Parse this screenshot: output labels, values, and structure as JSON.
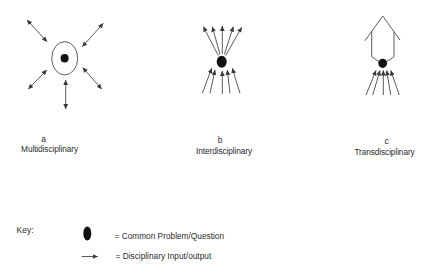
{
  "colors": {
    "background": "#ffffff",
    "line": "#4a4a4a",
    "dot": "#111111",
    "text": "#2b2b2b"
  },
  "diagrams": [
    {
      "letter": "a",
      "label": "Multidisciplinary",
      "ring": {
        "cx": 64.7,
        "cy": 58.3,
        "rx": 13,
        "ry": 16.7
      },
      "dot": {
        "cx": 64.6,
        "cy": 58.3,
        "rx": 4,
        "ry": 4.2
      },
      "outlines": [],
      "arrows": [
        {
          "from": [
            27,
            20
          ],
          "to": [
            47,
            41.7
          ],
          "double": true
        },
        {
          "from": [
            103.3,
            23.3
          ],
          "to": [
            82.3,
            46.7
          ],
          "double": true
        },
        {
          "from": [
            46.7,
            70
          ],
          "to": [
            28.3,
            89
          ],
          "double": true
        },
        {
          "from": [
            82.7,
            67.7
          ],
          "to": [
            101.7,
            89
          ],
          "double": true
        },
        {
          "from": [
            65.7,
            80
          ],
          "to": [
            65.7,
            109
          ],
          "double": true
        }
      ]
    },
    {
      "letter": "b",
      "label": "Interdisciplinary",
      "ring": null,
      "dot": {
        "cx": 221.7,
        "cy": 61.7,
        "rx": 5,
        "ry": 6
      },
      "outlines": [],
      "arrows": [
        {
          "from": [
            218.3,
            55.5
          ],
          "to": [
            203.3,
            26.7
          ],
          "double": false
        },
        {
          "from": [
            220,
            54.5
          ],
          "to": [
            212.3,
            26.7
          ],
          "double": false
        },
        {
          "from": [
            222.3,
            54
          ],
          "to": [
            222.3,
            26
          ],
          "double": false
        },
        {
          "from": [
            224.3,
            54.5
          ],
          "to": [
            233.3,
            26.7
          ],
          "double": false
        },
        {
          "from": [
            225.7,
            55.5
          ],
          "to": [
            241.7,
            27.3
          ],
          "double": false
        },
        {
          "from": [
            202.3,
            93.3
          ],
          "to": [
            211.7,
            68.3
          ],
          "double": false
        },
        {
          "from": [
            210,
            93.3
          ],
          "to": [
            215,
            70
          ],
          "double": false
        },
        {
          "from": [
            222.3,
            94
          ],
          "to": [
            222.3,
            71
          ],
          "double": false
        },
        {
          "from": [
            230,
            93.3
          ],
          "to": [
            227.3,
            70
          ],
          "double": false
        },
        {
          "from": [
            240,
            93.3
          ],
          "to": [
            232.3,
            68.3
          ],
          "double": false
        }
      ]
    },
    {
      "letter": "c",
      "label": "Transdisciplinary",
      "ring": null,
      "dot": {
        "cx": 382.7,
        "cy": 63.3,
        "rx": 4.4,
        "ry": 4.6
      },
      "outlines": [
        [
          [
            365,
            40.7
          ],
          [
            382.7,
            16
          ],
          [
            400,
            40
          ]
        ],
        [
          [
            371.7,
            31.3
          ],
          [
            371.7,
            56.7
          ],
          [
            379.2,
            61.8
          ]
        ],
        [
          [
            394,
            31.7
          ],
          [
            394,
            56.7
          ],
          [
            386.3,
            61.8
          ]
        ]
      ],
      "arrows": [
        {
          "from": [
            366,
            95
          ],
          "to": [
            376,
            70.5
          ],
          "double": false
        },
        {
          "from": [
            372.7,
            95
          ],
          "to": [
            380,
            70.5
          ],
          "double": false
        },
        {
          "from": [
            383.3,
            95
          ],
          "to": [
            383.3,
            70.5
          ],
          "double": false
        },
        {
          "from": [
            390.7,
            95
          ],
          "to": [
            386.7,
            70.5
          ],
          "double": false
        },
        {
          "from": [
            399.3,
            95
          ],
          "to": [
            390.7,
            70.5
          ],
          "double": false
        }
      ]
    }
  ],
  "key": {
    "title": "Key:",
    "items": [
      {
        "symbol": "common-problem-dot",
        "text": "= Common Problem/Question",
        "dot": {
          "cx": 87.3,
          "cy": 233.5,
          "rx": 4,
          "ry": 7
        }
      },
      {
        "symbol": "disciplinary-arrow",
        "text": "= Disciplinary Input/output",
        "arrow": {
          "from": [
            81.7,
            256.5
          ],
          "to": [
            97.7,
            256.5
          ]
        }
      }
    ]
  }
}
